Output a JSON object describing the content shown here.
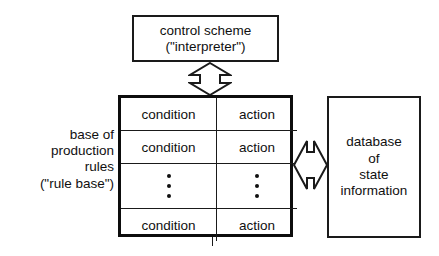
{
  "diagram": {
    "colors": {
      "stroke": "#1a1a1a",
      "table_stroke": "#0d0d0d",
      "background": "#ffffff",
      "text": "#101010"
    },
    "control_box": {
      "name": "control scheme box",
      "lines": [
        "control scheme",
        "(\"interpreter\")"
      ]
    },
    "left_caption": {
      "name": "base of production rules caption",
      "lines": [
        "base of",
        "production",
        "rules",
        "(\"rule base\")"
      ]
    },
    "rule_table": {
      "name": "production rule table",
      "columns": [
        "condition",
        "action"
      ],
      "rows": [
        {
          "type": "rule",
          "condition": "condition",
          "action": "action"
        },
        {
          "type": "rule",
          "condition": "condition",
          "action": "action"
        },
        {
          "type": "ellipsis",
          "condition": "⋮",
          "action": "⋮"
        },
        {
          "type": "rule",
          "condition": "condition",
          "action": "action"
        }
      ],
      "ellipsis_dot_count": 3
    },
    "database_box": {
      "name": "database of state information box",
      "lines": [
        "database",
        "of",
        "state",
        "information"
      ]
    },
    "arrows": [
      {
        "name": "vertical-double-arrow",
        "orientation": "vertical",
        "direction": "bidirectional",
        "connects": [
          "control scheme",
          "rule table"
        ]
      },
      {
        "name": "horizontal-double-arrow",
        "orientation": "horizontal",
        "direction": "bidirectional",
        "connects": [
          "rule table",
          "database of state information"
        ]
      }
    ]
  }
}
